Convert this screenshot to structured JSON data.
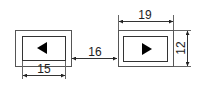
{
  "diagram": {
    "left_button": {
      "icon": "triangle-left-icon",
      "width_label": "15"
    },
    "right_button": {
      "icon": "triangle-right-icon",
      "width_label": "19",
      "height_label": "12"
    },
    "gap_label": "16",
    "colors": {
      "stroke": "#333333",
      "fill": "#000000",
      "background": "#ffffff"
    }
  }
}
